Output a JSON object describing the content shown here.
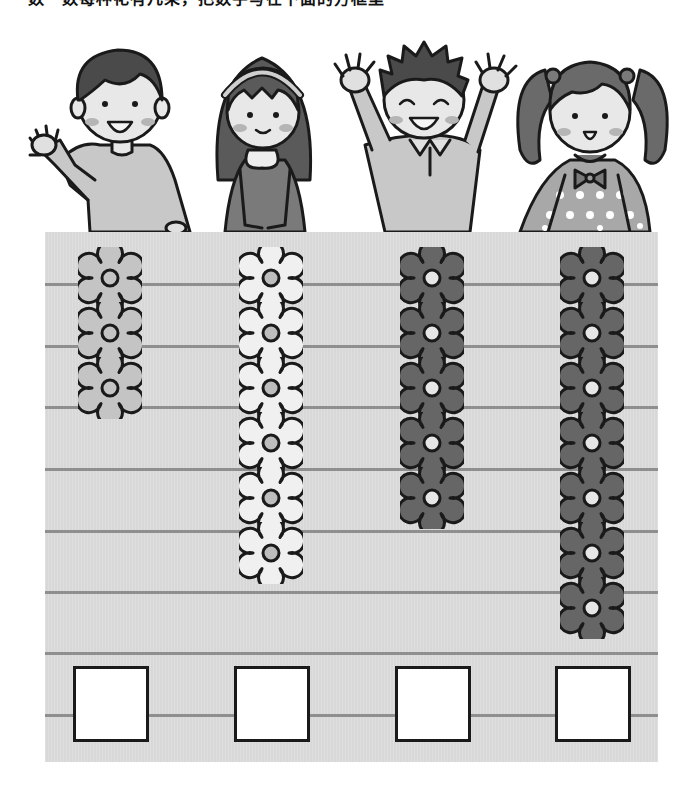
{
  "worksheet": {
    "header_text": "数一数每种花有几朵，把数字写在下面的方框里",
    "header_visible": "cropped",
    "children": [
      {
        "name": "boy-waving",
        "pose": "waving",
        "shirt_color": "#c8c8c8",
        "hair_color": "#4a4a4a"
      },
      {
        "name": "girl-headband",
        "pose": "hands-together",
        "dress_color": "#7a7a7a",
        "hair_color": "#5a5a5a"
      },
      {
        "name": "boy-arms-up",
        "pose": "arms-raised",
        "shirt_color": "#c8c8c8",
        "hair_color": "#4a4a4a"
      },
      {
        "name": "girl-pigtails",
        "pose": "standing",
        "dress_color": "#a8a8a8",
        "hair_color": "#6a6a6a"
      }
    ],
    "columns": [
      {
        "label": "column-1",
        "flower_count": 3,
        "petal_color": "#c4c4c4",
        "center_color": "#c4c4c4",
        "answer": ""
      },
      {
        "label": "column-2",
        "flower_count": 6,
        "petal_color": "#f0f0f0",
        "center_color": "#bdbdbd",
        "answer": ""
      },
      {
        "label": "column-3",
        "flower_count": 5,
        "petal_color": "#666666",
        "center_color": "#e6e6e6",
        "answer": ""
      },
      {
        "label": "column-4",
        "flower_count": 7,
        "petal_color": "#666666",
        "center_color": "#e6e6e6",
        "answer": ""
      }
    ],
    "colors": {
      "panel_bg": "#dcdcdc",
      "rule_line": "#8f8f8f",
      "outline": "#1a1a1a",
      "answer_box_bg": "#ffffff"
    }
  }
}
